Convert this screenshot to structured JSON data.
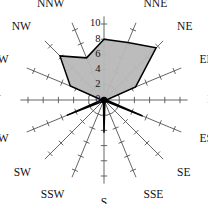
{
  "chart_data": {
    "type": "radar",
    "title": "",
    "subtitle": "",
    "xlabel": "",
    "ylabel": "",
    "categories": [
      "N",
      "NNE",
      "NE",
      "ENE",
      "E",
      "ESE",
      "SE",
      "SSE",
      "S",
      "SSW",
      "SW",
      "WSW",
      "W",
      "WNW",
      "NW",
      "NNW"
    ],
    "values": [
      8.0,
      8.2,
      9.7,
      4.5,
      0.3,
      5.5,
      0.2,
      0.3,
      4.3,
      0.2,
      0.3,
      5.3,
      0.3,
      4.8,
      8.2,
      6.0
    ],
    "series": [
      {
        "name": "wind frequency",
        "values": [
          8.0,
          8.2,
          9.7,
          4.5,
          0.3,
          5.5,
          0.2,
          0.3,
          4.3,
          0.2,
          0.3,
          5.3,
          0.3,
          4.8,
          8.2,
          6.0
        ]
      }
    ],
    "radial_ticks": [
      0,
      2,
      4,
      6,
      8,
      10
    ],
    "radial_tick_labels": [
      "0",
      "2",
      "4",
      "6",
      "8",
      "10"
    ],
    "rlim": [
      0,
      10
    ],
    "grid": false,
    "legend": "none",
    "legend_position": "none",
    "fill_color": "#b8b8b8",
    "line_color": "#000000",
    "spoke_color": "#555555",
    "background_color": "#ffffff",
    "tick_label_axis": "N",
    "start_angle_deg": 90,
    "direction": "clockwise"
  },
  "labels": {
    "n": "N",
    "nne": "NNE",
    "ne": "NE",
    "ene": "ENE",
    "e": "E",
    "ese": "ESE",
    "se": "SE",
    "sse": "SSE",
    "s": "S",
    "ssw": "SSW",
    "sw": "SW",
    "wsw": "WSW",
    "w": "W",
    "wnw": "WNW",
    "nw": "NW",
    "nnw": "NNW"
  },
  "radial_axis": {
    "tick_0": "0",
    "tick_2": "2",
    "tick_4": "4",
    "tick_6": "6",
    "tick_8": "8",
    "tick_10": "10"
  }
}
